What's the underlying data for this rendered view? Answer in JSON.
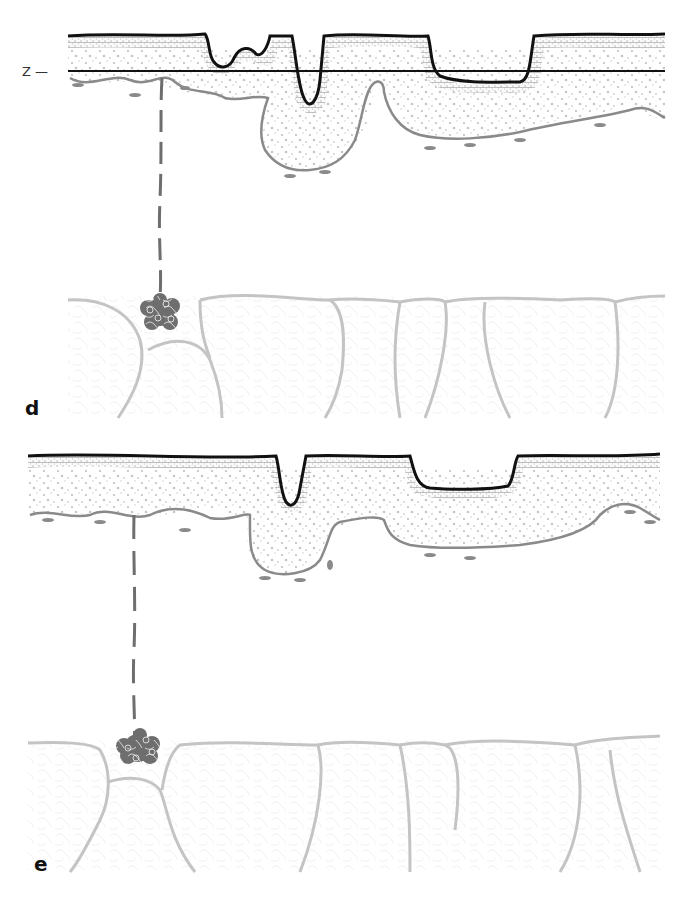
{
  "figure": {
    "panels": [
      {
        "id": "d",
        "label": "d",
        "reference_line_label": "Z —"
      },
      {
        "id": "e",
        "label": "e"
      }
    ],
    "colors": {
      "epidermis_outline": "#111111",
      "dermis_outline": "#8a8a8a",
      "follicle": "#6e6e6e",
      "fat_lobule_outline": "#c4c4c4",
      "stipple": "#b8b8b8"
    }
  }
}
